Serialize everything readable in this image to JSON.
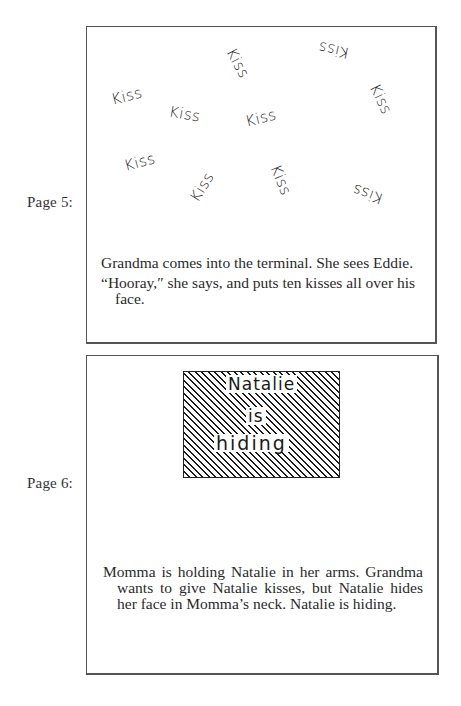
{
  "pages": [
    {
      "label": "Page 5:",
      "illustration": {
        "type": "scattered-handwritten-words",
        "words": [
          {
            "text": "Kiss",
            "x": 135,
            "y": 27,
            "rotate": 62
          },
          {
            "text": "Kiss",
            "x": 231,
            "y": 14,
            "rotate": 192
          },
          {
            "text": "Kiss",
            "x": 24,
            "y": 60,
            "rotate": -14
          },
          {
            "text": "Kiss",
            "x": 82,
            "y": 78,
            "rotate": 10
          },
          {
            "text": "Kiss",
            "x": 158,
            "y": 82,
            "rotate": -14
          },
          {
            "text": "Kiss",
            "x": 278,
            "y": 63,
            "rotate": 64
          },
          {
            "text": "Kiss",
            "x": 37,
            "y": 126,
            "rotate": -15
          },
          {
            "text": "Kiss",
            "x": 99,
            "y": 151,
            "rotate": -58
          },
          {
            "text": "Kiss",
            "x": 178,
            "y": 144,
            "rotate": 68
          },
          {
            "text": "Kiss",
            "x": 265,
            "y": 158,
            "rotate": 200
          }
        ]
      },
      "caption": [
        "Grandma comes into the terminal. She sees Eddie.",
        "“Hooray,″ she says, and puts ten kisses all over his face."
      ]
    },
    {
      "label": "Page 6:",
      "illustration": {
        "type": "hatched-box",
        "lines": [
          "Natalie",
          "is",
          "hiding"
        ]
      },
      "caption": [
        "Momma is holding Natalie in her arms. Grandma wants to give Natalie kisses, but Natalie hides her face in Momma’s neck. Natalie is hiding."
      ]
    }
  ]
}
